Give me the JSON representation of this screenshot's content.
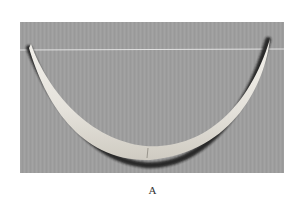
{
  "figure": {
    "caption": "A",
    "colors": {
      "background": "#9e9e9e",
      "object": "#e9e7e1",
      "shadow": "#1e1e1e",
      "line": "#f2f2f2",
      "page": "#ffffff"
    }
  }
}
